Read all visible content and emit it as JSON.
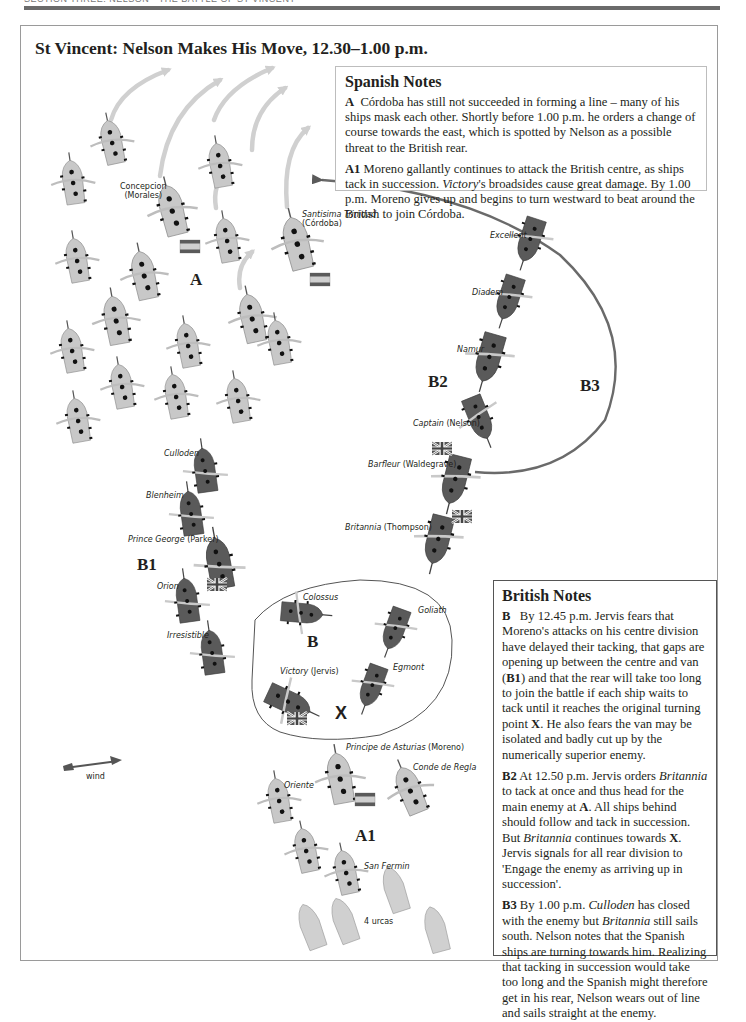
{
  "header": {
    "running_head": "SECTION THREE: NELSON · THE BATTLE OF ST VINCENT"
  },
  "map": {
    "title": "St Vincent: Nelson Makes His Move, 12.30–1.00 p.m.",
    "colors": {
      "spanish_ship": "#c8c8c8",
      "british_ship": "#5a5a5a",
      "course_arrow": "#cfcfcf",
      "track_line": "#6a6a6a"
    },
    "group_labels": {
      "A": "A",
      "A1": "A1",
      "B": "B",
      "B1": "B1",
      "B2": "B2",
      "B3": "B3",
      "X": "X"
    },
    "wind_label": "wind",
    "urcas_label": "4 urcas",
    "spanish_ships": [
      {
        "name": "Concepcion",
        "commander": "(Morales)"
      },
      {
        "name": "Santisima Trinidad",
        "commander": "(Córdoba)"
      },
      {
        "name": "Principe de Asturias",
        "commander": "(Moreno)"
      },
      {
        "name": "Conde de Regla",
        "commander": ""
      },
      {
        "name": "Oriente",
        "commander": ""
      },
      {
        "name": "San Fermin",
        "commander": ""
      }
    ],
    "british_ships": [
      {
        "name": "Excellent",
        "commander": ""
      },
      {
        "name": "Diadem",
        "commander": ""
      },
      {
        "name": "Namur",
        "commander": ""
      },
      {
        "name": "Captain",
        "commander": "(Nelson)"
      },
      {
        "name": "Barfleur",
        "commander": "(Waldegrave)"
      },
      {
        "name": "Britannia",
        "commander": "(Thompson)"
      },
      {
        "name": "Culloden",
        "commander": ""
      },
      {
        "name": "Blenheim",
        "commander": ""
      },
      {
        "name": "Prince George",
        "commander": "(Parker)"
      },
      {
        "name": "Orion",
        "commander": ""
      },
      {
        "name": "Irresistible",
        "commander": ""
      },
      {
        "name": "Colossus",
        "commander": ""
      },
      {
        "name": "Goliath",
        "commander": ""
      },
      {
        "name": "Egmont",
        "commander": ""
      },
      {
        "name": "Victory",
        "commander": "(Jervis)"
      }
    ]
  },
  "spanish_notes": {
    "heading": "Spanish Notes",
    "items": [
      {
        "key": "A",
        "text": "Córdoba has still not succeeded in forming a line – many of his ships mask each other. Shortly before 1.00 p.m. he orders a change of course towards the east, which is spotted by Nelson as a possible threat to the British rear."
      },
      {
        "key": "A1",
        "text_before": "Moreno gallantly continues to attack the British centre, as ships tack in succession. ",
        "italic": "Victory",
        "text_after": "'s broadsides cause great damage. By 1.00 p.m. Moreno gives up and begins to turn westward to beat around the British to join Córdoba."
      }
    ]
  },
  "british_notes": {
    "heading": "British Notes",
    "items": [
      {
        "key": "B",
        "parts": [
          "By 12.45 p.m. Jervis fears that Moreno's attacks on his centre division have delayed their tacking, that gaps are opening up between the centre and van (",
          "B1",
          ") and that the rear will take too long to join the battle if each ship waits to tack until it reaches the original turning point ",
          "X",
          ". He also fears the van may be isolated and badly cut up by the numerically superior enemy."
        ]
      },
      {
        "key": "B2",
        "parts": [
          "At 12.50 p.m. Jervis orders ",
          "Britannia",
          " to tack at once and thus head for the main enemy at ",
          "A",
          ". All ships behind should follow and tack in succession. But ",
          "Britannia",
          " continues towards ",
          "X",
          ". Jervis signals for all rear division to 'Engage the enemy as arriving up in succession'."
        ]
      },
      {
        "key": "B3",
        "parts": [
          "By 1.00 p.m. ",
          "Culloden",
          " has closed with the enemy but ",
          "Britannia",
          " still sails south. Nelson notes that the Spanish ships are turning towards him. Realizing that tacking in succession would take too long and the Spanish might therefore get in his rear, Nelson wears out of line and sails straight at the enemy."
        ]
      }
    ]
  }
}
